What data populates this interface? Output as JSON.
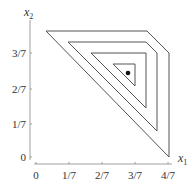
{
  "axes": {
    "x_label": "x",
    "x_sub": "1",
    "y_label": "x",
    "y_sub": "2",
    "x_ticks": [
      {
        "label": "0",
        "px": 36
      },
      {
        "label": "1/7",
        "px": 69
      },
      {
        "label": "2/7",
        "px": 102
      },
      {
        "label": "3/7",
        "px": 135
      },
      {
        "label": "4/7",
        "px": 168
      }
    ],
    "y_ticks": [
      {
        "label": "0",
        "py": 157
      },
      {
        "label": "1/7",
        "py": 124
      },
      {
        "label": "2/7",
        "py": 89
      },
      {
        "label": "3/7",
        "py": 53
      }
    ]
  },
  "polygons": [
    {
      "name": "outer-region",
      "points": "46,31 147,31 169,53 169,157"
    },
    {
      "name": "second-region",
      "points": "68,42 146,42 157,53 157,131"
    },
    {
      "name": "third-region",
      "points": "91,53 146,53 146,108"
    },
    {
      "name": "inner-region",
      "points": "113,64 135,64 135,86"
    }
  ],
  "point": {
    "cx": 128,
    "cy": 73,
    "r": 2.3
  },
  "colors": {
    "line": "#555555",
    "axis": "#888888",
    "dot": "#111111"
  }
}
